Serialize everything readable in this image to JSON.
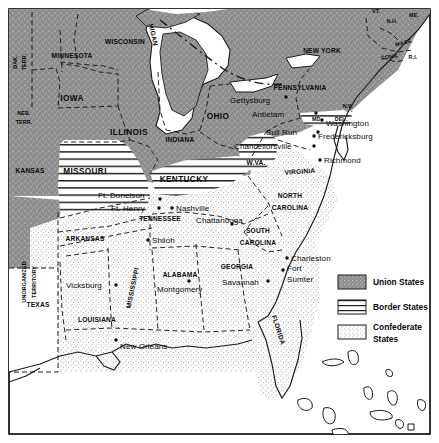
{
  "map": {
    "title": "Civil War States Map",
    "frame": {
      "border_color": "#000000",
      "background": "#ffffff"
    },
    "colors": {
      "union_fill": "#8f8f8f",
      "confederate_fill": "#e3e3e3",
      "border_fill": "#ffffff",
      "territory_fill": "#ffffff",
      "water": "#ffffff",
      "line": "#1a1a1a",
      "text": "#0a0a0a"
    },
    "legend": {
      "items": [
        {
          "label": "Union States",
          "pattern": "dense-stipple-gray",
          "swatch": "#8f8f8f"
        },
        {
          "label": "Border States",
          "pattern": "horizontal-lines",
          "swatch": "#ffffff"
        },
        {
          "label": "Confederate States",
          "label_line1": "Confederate",
          "label_line2": "States",
          "pattern": "light-stipple",
          "swatch": "#ffffff"
        }
      ]
    },
    "territories": [
      {
        "name": "DAK. TERR.",
        "line1": "DAK.",
        "line2": "TERR.",
        "x": 20,
        "y": 60,
        "rotate": -90,
        "class": "state-xs"
      },
      {
        "name": "NEB. TERR.",
        "line1": "NEB.",
        "line2": "TERR.",
        "x": 24,
        "y": 117,
        "rotate": 0,
        "class": "state-xs"
      },
      {
        "name": "UNORGANIZED TERRITORY",
        "line1": "UNORGANIZED",
        "line2": "TERRITORY",
        "x": 28,
        "y": 245,
        "rotate": -90,
        "class": "state-xs"
      }
    ],
    "union_states": [
      {
        "name": "MINNESOTA",
        "x": 72,
        "y": 56,
        "class": "state-sm"
      },
      {
        "name": "WISCONSIN",
        "x": 125,
        "y": 42,
        "class": "state-sm"
      },
      {
        "name": "IOWA",
        "x": 72,
        "y": 99,
        "class": "state"
      },
      {
        "name": "ILLINOIS",
        "x": 129,
        "y": 133,
        "class": "state"
      },
      {
        "name": "INDIANA",
        "x": 180,
        "y": 140,
        "class": "state-sm"
      },
      {
        "name": "OHIO",
        "x": 218,
        "y": 117,
        "class": "state"
      },
      {
        "name": "MICHIGAN",
        "x": 0,
        "y": 0,
        "class": "state-sm",
        "curved": true
      },
      {
        "name": "KANSAS",
        "x": 30,
        "y": 171,
        "class": "state-sm"
      },
      {
        "name": "PENNSYLVANIA",
        "x": 300,
        "y": 88,
        "class": "state-sm"
      },
      {
        "name": "NEW YORK",
        "x": 322,
        "y": 51,
        "class": "state-sm"
      },
      {
        "name": "VT.",
        "x": 376,
        "y": 12,
        "class": "state-xs"
      },
      {
        "name": "N.H.",
        "x": 392,
        "y": 22,
        "class": "state-xs"
      },
      {
        "name": "ME.",
        "x": 414,
        "y": 16,
        "class": "state-xs"
      },
      {
        "name": "MASS.",
        "x": 404,
        "y": 43,
        "class": "state-xs"
      },
      {
        "name": "CONN.",
        "x": 390,
        "y": 57,
        "class": "state-xs"
      },
      {
        "name": "R.I.",
        "x": 413,
        "y": 58,
        "class": "state-xs"
      },
      {
        "name": "N.J.",
        "x": 348,
        "y": 107,
        "class": "state-xs"
      }
    ],
    "border_states": [
      {
        "name": "MISSOURI",
        "x": 85,
        "y": 172,
        "class": "state"
      },
      {
        "name": "KENTUCKY",
        "x": 184,
        "y": 180,
        "class": "state"
      },
      {
        "name": "W.VA.",
        "x": 256,
        "y": 163,
        "class": "state-sm"
      },
      {
        "name": "MD.",
        "x": 317,
        "y": 120,
        "class": "state-xs"
      },
      {
        "name": "DEL.",
        "x": 341,
        "y": 120,
        "class": "state-xs"
      }
    ],
    "confederate_states": [
      {
        "name": "VIRGINIA",
        "x": 300,
        "y": 172,
        "class": "state-sm"
      },
      {
        "name": "NORTH CAROLINA",
        "line1": "NORTH",
        "line2": "CAROLINA",
        "x": 290,
        "y": 201,
        "class": "state-sm"
      },
      {
        "name": "SOUTH CAROLINA",
        "line1": "SOUTH",
        "line2": "CAROLINA",
        "x": 258,
        "y": 237,
        "class": "state-sm"
      },
      {
        "name": "TENNESSEE",
        "x": 160,
        "y": 219,
        "class": "state-sm"
      },
      {
        "name": "ARKANSAS",
        "x": 85,
        "y": 239,
        "class": "state-sm"
      },
      {
        "name": "MISSISSIPPI",
        "x": 133,
        "y": 288,
        "class": "state-sm",
        "rotate": -78
      },
      {
        "name": "ALABAMA",
        "x": 180,
        "y": 275,
        "class": "state-sm"
      },
      {
        "name": "GEORGIA",
        "x": 237,
        "y": 267,
        "class": "state-sm"
      },
      {
        "name": "LOUISIANA",
        "x": 97,
        "y": 320,
        "class": "state-sm"
      },
      {
        "name": "TEXAS",
        "x": 38,
        "y": 305,
        "class": "state-sm"
      },
      {
        "name": "FLORIDA",
        "x": 278,
        "y": 330,
        "class": "state-sm",
        "rotate": 72
      }
    ],
    "cities": [
      {
        "name": "Gettysburg",
        "x": 294,
        "y": 101,
        "dot_x": 286,
        "dot_y": 97,
        "anchor": "start"
      },
      {
        "name": "Antietam",
        "x": 287,
        "y": 113,
        "dot_x": 316,
        "dot_y": 113,
        "anchor": "start"
      },
      {
        "name": "Washington",
        "x": 300,
        "y": 124,
        "dot_x": 322,
        "dot_y": 120,
        "anchor": "start"
      },
      {
        "name": "Bull Run",
        "x": 272,
        "y": 134,
        "dot_x": 318,
        "dot_y": 132,
        "anchor": "start"
      },
      {
        "name": "Fredericksburg",
        "x": 320,
        "y": 135,
        "dot_x": 314,
        "dot_y": 136,
        "anchor": "start"
      },
      {
        "name": "Chancellorsville",
        "x": 244,
        "y": 147,
        "dot_x": 314,
        "dot_y": 146,
        "anchor": "start"
      },
      {
        "name": "Richmond",
        "x": 327,
        "y": 161,
        "dot_x": 320,
        "dot_y": 160,
        "anchor": "start"
      },
      {
        "name": "Ft. Donelson",
        "x": 98,
        "y": 195,
        "dot_x": 160,
        "dot_y": 199,
        "anchor": "start"
      },
      {
        "name": "Ft. Henry",
        "x": 111,
        "y": 211,
        "dot_x": 159,
        "dot_y": 208,
        "anchor": "start"
      },
      {
        "name": "Nashville",
        "x": 177,
        "y": 209,
        "dot_x": 172,
        "dot_y": 208,
        "anchor": "start"
      },
      {
        "name": "Chattanooga",
        "x": 200,
        "y": 220,
        "dot_x": 232,
        "dot_y": 224,
        "anchor": "start"
      },
      {
        "name": "Shiloh",
        "x": 150,
        "y": 240,
        "dot_x": 148,
        "dot_y": 240,
        "anchor": "start"
      },
      {
        "name": "Vicksburg",
        "x": 68,
        "y": 285,
        "dot_x": 116,
        "dot_y": 285,
        "anchor": "start"
      },
      {
        "name": "Montgomery",
        "x": 160,
        "y": 287,
        "dot_x": 189,
        "dot_y": 281,
        "anchor": "start"
      },
      {
        "name": "Savannah",
        "x": 226,
        "y": 285,
        "dot_x": 268,
        "dot_y": 281,
        "anchor": "start"
      },
      {
        "name": "Charleston",
        "x": 293,
        "y": 259,
        "dot_x": 287,
        "dot_y": 258,
        "anchor": "start"
      },
      {
        "name": "Fort Sumter",
        "line1": "Fort",
        "line2": "Sumter",
        "x": 287,
        "y": 269,
        "dot_x": 283,
        "dot_y": 270,
        "anchor": "start"
      },
      {
        "name": "New Orleans",
        "x": 120,
        "y": 345,
        "dot_x": 116,
        "dot_y": 340,
        "anchor": "start"
      }
    ]
  }
}
